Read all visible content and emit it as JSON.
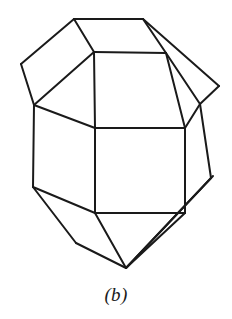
{
  "figure": {
    "caption": "(b)",
    "kind": "line-drawing",
    "background_color": "#ffffff",
    "line_color": "#1a1a1a",
    "line_width": 2.0,
    "canvas": {
      "width": 232,
      "height": 319
    }
  },
  "geometry": {
    "vertices": {
      "top_left": [
        74,
        19
      ],
      "top_right": [
        143,
        19
      ],
      "upper_left_outer": [
        21,
        64
      ],
      "upper_right_outer": [
        219,
        86
      ],
      "face_top_left": [
        94,
        52
      ],
      "face_top_right": [
        166,
        53
      ],
      "mid_left_junction": [
        34,
        105
      ],
      "face_mid_left": [
        95,
        128
      ],
      "face_mid_right": [
        185,
        128
      ],
      "right_upper_shoulder": [
        200,
        104
      ],
      "left_lower_junction": [
        33,
        187
      ],
      "face_bottom_left": [
        95,
        213
      ],
      "face_bottom_right": [
        185,
        213
      ],
      "right_lower_vertex": [
        211,
        178
      ],
      "bottom_left_bend": [
        76,
        243
      ],
      "bottom_apex": [
        126,
        268
      ],
      "right_sliver_top": [
        213,
        176
      ],
      "left_edge_top": [
        21,
        64
      ],
      "left_edge_bottom": [
        33,
        187
      ]
    },
    "edges": [
      [
        "top_left",
        "top_right"
      ],
      [
        "top_left",
        "upper_left_outer"
      ],
      [
        "top_right",
        "upper_right_outer"
      ],
      [
        "top_left",
        "face_top_left"
      ],
      [
        "top_right",
        "face_top_right"
      ],
      [
        "face_top_left",
        "face_top_right"
      ],
      [
        "face_top_left",
        "face_mid_left"
      ],
      [
        "face_top_right",
        "face_mid_right"
      ],
      [
        "face_mid_left",
        "face_mid_right"
      ],
      [
        "upper_left_outer",
        "mid_left_junction"
      ],
      [
        "mid_left_junction",
        "face_top_left"
      ],
      [
        "mid_left_junction",
        "face_mid_left"
      ],
      [
        "mid_left_junction",
        "left_lower_junction"
      ],
      [
        "upper_right_outer",
        "right_upper_shoulder"
      ],
      [
        "right_upper_shoulder",
        "face_mid_right"
      ],
      [
        "right_upper_shoulder",
        "face_top_right"
      ],
      [
        "right_upper_shoulder",
        "right_lower_vertex"
      ],
      [
        "face_mid_left",
        "face_bottom_left"
      ],
      [
        "face_mid_right",
        "face_bottom_right"
      ],
      [
        "face_bottom_left",
        "face_bottom_right"
      ],
      [
        "left_lower_junction",
        "face_bottom_left"
      ],
      [
        "left_lower_junction",
        "bottom_left_bend"
      ],
      [
        "bottom_left_bend",
        "bottom_apex"
      ],
      [
        "face_bottom_left",
        "bottom_apex"
      ],
      [
        "face_bottom_right",
        "bottom_apex"
      ],
      [
        "right_lower_vertex",
        "bottom_apex"
      ],
      [
        "right_sliver_top",
        "bottom_apex"
      ]
    ],
    "face_count_visible": 13
  }
}
